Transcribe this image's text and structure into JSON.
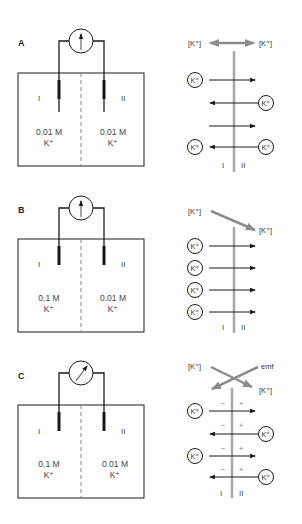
{
  "panels": [
    {
      "id": "A",
      "label": "A",
      "cell": {
        "left_compartment": "I",
        "right_compartment": "II",
        "left_conc": "0.01 M",
        "left_ion": "K⁺",
        "right_conc": "0.01 M",
        "right_ion": "K⁺",
        "meter_needle": "vertical"
      },
      "flux": {
        "top_left": "[K⁺]",
        "top_right": "[K⁺]",
        "gradient_arrow": "double-headed horizontal (equal concentrations)",
        "ion_label": "K⁺",
        "side_left": "I",
        "side_right": "II",
        "arrows": [
          "right",
          "left",
          "right",
          "left"
        ]
      }
    },
    {
      "id": "B",
      "label": "B",
      "cell": {
        "left_compartment": "I",
        "right_compartment": "II",
        "left_conc": "0.1 M",
        "left_ion": "K⁺",
        "right_conc": "0.01 M",
        "right_ion": "K⁺",
        "meter_needle": "vertical"
      },
      "flux": {
        "top_left": "[K⁺]",
        "top_right": "[K⁺]",
        "gradient_arrow": "diagonal down-right (high to low)",
        "ion_label": "K⁺",
        "side_left": "I",
        "side_right": "II",
        "arrows": [
          "right",
          "right",
          "right",
          "right"
        ]
      }
    },
    {
      "id": "C",
      "label": "C",
      "cell": {
        "left_compartment": "I",
        "right_compartment": "II",
        "left_conc": "0.1 M",
        "left_ion": "K⁺",
        "right_conc": "0.01 M",
        "right_ion": "K⁺",
        "meter_needle": "deflected"
      },
      "flux": {
        "top_left": "[K⁺]",
        "top_right_emf": "emf",
        "bottom_right": "[K⁺]",
        "gradient_arrow": "crossing arrows ([K⁺] vs emf)",
        "ion_label": "K⁺",
        "side_left": "I",
        "side_right": "II",
        "minus": "−",
        "plus": "+",
        "arrows": [
          "right",
          "left",
          "right",
          "left"
        ]
      }
    }
  ],
  "colors": {
    "line": "#1a1a1a",
    "membrane": "#a8a8a8",
    "gradient_arrow": "#8c8c8c",
    "text": "#444444"
  }
}
